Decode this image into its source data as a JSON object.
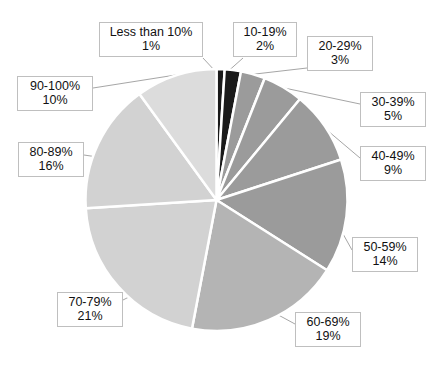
{
  "chart_data": {
    "type": "pie",
    "title": "",
    "subtitle": "",
    "xlabel": "",
    "ylabel": "",
    "legend_position": "none",
    "grid": false,
    "labels_show_category": true,
    "labels_show_percent": true,
    "start_angle_deg": 0,
    "direction": "clockwise",
    "categories": [
      "Less than 10%",
      "10-19%",
      "20-29%",
      "30-39%",
      "40-49%",
      "50-59%",
      "60-69%",
      "70-79%",
      "80-89%",
      "90-100%"
    ],
    "values": [
      1,
      2,
      3,
      5,
      9,
      14,
      19,
      21,
      16,
      10
    ],
    "value_labels": [
      "1%",
      "2%",
      "3%",
      "5%",
      "9%",
      "14%",
      "19%",
      "21%",
      "16%",
      "10%"
    ],
    "colors": [
      "#1a1a1a",
      "#1a1a1a",
      "#9b9b9b",
      "#9b9b9b",
      "#1a1a1a",
      "#9b9b9b",
      "#b4b4b4",
      "#d2d2d2",
      "#d2d2d2",
      "#dcdcdc"
    ],
    "slice_border_color": "#ffffff",
    "slices": [
      {
        "label": "Less than 10%",
        "value": 1,
        "percent_text": "1%",
        "color": "#1a1a1a"
      },
      {
        "label": "10-19%",
        "value": 2,
        "percent_text": "2%",
        "color": "#1a1a1a"
      },
      {
        "label": "20-29%",
        "value": 3,
        "percent_text": "3%",
        "color": "#9b9b9b"
      },
      {
        "label": "30-39%",
        "value": 5,
        "percent_text": "5%",
        "color": "#9b9b9b"
      },
      {
        "label": "40-49%",
        "value": 9,
        "percent_text": "9%",
        "color": "#9b9b9b"
      },
      {
        "label": "50-59%",
        "value": 14,
        "percent_text": "14%",
        "color": "#9b9b9b"
      },
      {
        "label": "60-69%",
        "value": 19,
        "percent_text": "19%",
        "color": "#b4b4b4"
      },
      {
        "label": "70-79%",
        "value": 21,
        "percent_text": "21%",
        "color": "#d2d2d2"
      },
      {
        "label": "80-89%",
        "value": 16,
        "percent_text": "16%",
        "color": "#d2d2d2"
      },
      {
        "label": "90-100%",
        "value": 10,
        "percent_text": "10%",
        "color": "#dcdcdc"
      }
    ]
  },
  "callouts": {
    "lt10": {
      "category": "Less than 10%",
      "value": "1%"
    },
    "c10_19": {
      "category": "10-19%",
      "value": "2%"
    },
    "c20_29": {
      "category": "20-29%",
      "value": "3%"
    },
    "c30_39": {
      "category": "30-39%",
      "value": "5%"
    },
    "c40_49": {
      "category": "40-49%",
      "value": "9%"
    },
    "c50_59": {
      "category": "50-59%",
      "value": "14%"
    },
    "c60_69": {
      "category": "60-69%",
      "value": "19%"
    },
    "c70_79": {
      "category": "70-79%",
      "value": "21%"
    },
    "c80_89": {
      "category": "80-89%",
      "value": "16%"
    },
    "c90_100": {
      "category": "90-100%",
      "value": "10%"
    }
  },
  "style": {
    "background": "#ffffff",
    "leader_line_color": "#a6a6a6",
    "callout_border_color": "#bfbfbf",
    "text_color": "#111111"
  }
}
